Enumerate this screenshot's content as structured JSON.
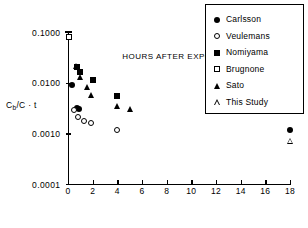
{
  "chart_data": {
    "type": "scatter",
    "title": "",
    "xlabel": "HOURS AFTER EXPOSURE",
    "ylabel": "Cb/C · t",
    "yscale": "log",
    "xlim": [
      0,
      18
    ],
    "ylim": [
      0.0001,
      0.1
    ],
    "grid": false,
    "legend_position": "upper-right",
    "xticks": [
      "0",
      "2",
      "4",
      "6",
      "8",
      "10",
      "12",
      "14",
      "16",
      "18"
    ],
    "xtick_values": [
      0,
      2,
      4,
      6,
      8,
      10,
      12,
      14,
      16,
      18
    ],
    "yticks": [
      "0.1000",
      "0.0100",
      "0.0010",
      "0.0001"
    ],
    "ytick_values": [
      0.1,
      0.01,
      0.001,
      0.0001
    ],
    "series": [
      {
        "name": "Carlsson",
        "marker": "filled-circle",
        "points": [
          {
            "x": 0.35,
            "y": 0.0088
          },
          {
            "x": 0.75,
            "y": 0.0032
          },
          {
            "x": 0.9,
            "y": 0.003
          },
          {
            "x": 18.0,
            "y": 0.00118
          }
        ]
      },
      {
        "name": "Veulemans",
        "marker": "open-circle",
        "points": [
          {
            "x": 0.5,
            "y": 0.0029
          },
          {
            "x": 0.85,
            "y": 0.0021
          },
          {
            "x": 1.3,
            "y": 0.00172
          },
          {
            "x": 1.85,
            "y": 0.00158
          },
          {
            "x": 4.0,
            "y": 0.00116
          }
        ]
      },
      {
        "name": "Nomiyama",
        "marker": "filled-square",
        "points": [
          {
            "x": 0.7,
            "y": 0.0205
          },
          {
            "x": 0.95,
            "y": 0.0163
          },
          {
            "x": 2.0,
            "y": 0.0112
          },
          {
            "x": 4.0,
            "y": 0.0055
          }
        ]
      },
      {
        "name": "Brugnone",
        "marker": "open-square",
        "points": [
          {
            "x": 0.05,
            "y": 0.0805
          }
        ],
        "error_bar": {
          "x": 0.05,
          "low": 0.0805,
          "high": 0.1025
        }
      },
      {
        "name": "Sato",
        "marker": "filled-triangle",
        "points": [
          {
            "x": 0.68,
            "y": 0.021
          },
          {
            "x": 0.95,
            "y": 0.0132
          },
          {
            "x": 1.5,
            "y": 0.0082
          },
          {
            "x": 1.85,
            "y": 0.0058
          },
          {
            "x": 4.0,
            "y": 0.0035
          },
          {
            "x": 5.0,
            "y": 0.003
          }
        ]
      },
      {
        "name": "This Study",
        "marker": "open-triangle",
        "points": [
          {
            "x": 18.0,
            "y": 0.00072
          }
        ]
      }
    ]
  },
  "legend": {
    "items": [
      {
        "label": "Carlsson",
        "marker": "filled-circle"
      },
      {
        "label": "Veulemans",
        "marker": "open-circle"
      },
      {
        "label": "Nomiyama",
        "marker": "filled-square"
      },
      {
        "label": "Brugnone",
        "marker": "open-square"
      },
      {
        "label": "Sato",
        "marker": "filled-triangle"
      },
      {
        "label": "This Study",
        "marker": "open-triangle"
      }
    ]
  },
  "axes": {
    "y_title_main": "Cb/C",
    "y_title_sub": "b",
    "y_title_rest": "/C · t"
  }
}
